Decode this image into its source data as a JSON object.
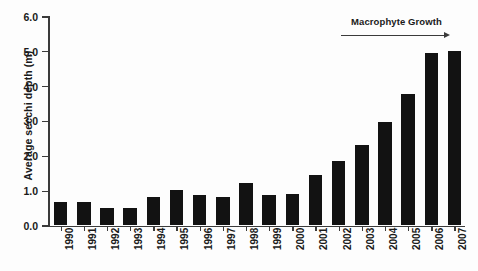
{
  "chart_data": {
    "type": "bar",
    "title": "",
    "xlabel": "",
    "ylabel": "Average secchi depth (m)",
    "categories": [
      "1990",
      "1991",
      "1992",
      "1993",
      "1994",
      "1995",
      "1996",
      "1997",
      "1998",
      "1999",
      "2000",
      "2001",
      "2002",
      "2003",
      "2004",
      "2005",
      "2006",
      "2007"
    ],
    "values": [
      0.65,
      0.65,
      0.5,
      0.5,
      0.8,
      1.0,
      0.85,
      0.8,
      1.2,
      0.85,
      0.9,
      1.45,
      1.85,
      2.3,
      2.95,
      3.75,
      4.95,
      5.0
    ],
    "ylim": [
      0.0,
      6.0
    ],
    "ytick_labels": [
      "0.0",
      "1.0",
      "2.0",
      "3.0",
      "4.0",
      "5.0",
      "6.0"
    ],
    "ytick_values": [
      0.0,
      1.0,
      2.0,
      3.0,
      4.0,
      5.0,
      6.0
    ],
    "grid": false,
    "legend": null,
    "bar_color": "#121212",
    "axis_color": "#3b3b3b",
    "annotations": [
      {
        "name": "macrophyte-growth",
        "text": "Macrophyte Growth",
        "arrow": "right",
        "span_categories": [
          "2002",
          "2007"
        ]
      }
    ]
  }
}
